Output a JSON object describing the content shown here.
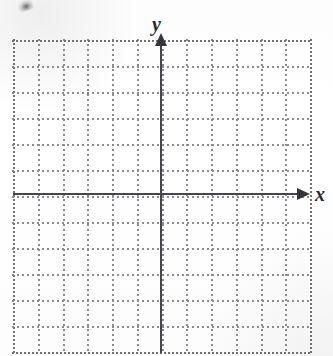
{
  "figure": {
    "kind": "blank-coordinate-grid",
    "title": "",
    "background_color": "#fefefe"
  },
  "axes": {
    "x": {
      "label": "x",
      "label_style": "italic-serif",
      "color": "#45454a",
      "arrowhead": "right",
      "arrow_icon_name": "x-axis-arrow-icon"
    },
    "y": {
      "label": "y",
      "label_style": "italic-serif",
      "color": "#45454a",
      "arrowhead": "up",
      "arrow_icon_name": "y-axis-arrow-icon"
    },
    "origin_label": ""
  },
  "grid": {
    "style": "dotted",
    "color": "#8c8c90",
    "edge_color": "#6f6f74",
    "columns": 12,
    "rows": 12,
    "columns_left_of_y_axis": 6,
    "columns_right_of_y_axis": 6,
    "rows_above_x_axis": 6,
    "rows_below_x_axis": 6,
    "cell_size_px": 24.75,
    "vertical_line_x": [
      0,
      24.75,
      49.5,
      74.25,
      99,
      123.75,
      148.5,
      173.25,
      198,
      222.75,
      247.5,
      272.25,
      297
    ],
    "horizontal_line_y": [
      0,
      26,
      52,
      78,
      104,
      130,
      156,
      182,
      208,
      234,
      260,
      286,
      312
    ],
    "tick_labels_visible": false
  },
  "chart_data": {
    "type": "scatter",
    "title": "",
    "xlabel": "x",
    "ylabel": "y",
    "xlim": [
      -6,
      6
    ],
    "ylim": [
      -6,
      6
    ],
    "xticks": [
      -6,
      -5,
      -4,
      -3,
      -2,
      -1,
      0,
      1,
      2,
      3,
      4,
      5,
      6
    ],
    "yticks": [
      -6,
      -5,
      -4,
      -3,
      -2,
      -1,
      0,
      1,
      2,
      3,
      4,
      5,
      6
    ],
    "tick_labels": [],
    "grid": true,
    "grid_style": "dotted",
    "legend": null,
    "series": [],
    "x": [],
    "y": [],
    "annotations": [],
    "note": "Empty coordinate plane: dotted 12x12 grid with labeled x and y axes, no plotted data."
  },
  "artifacts": {
    "scan_smudge_top_left": true
  }
}
